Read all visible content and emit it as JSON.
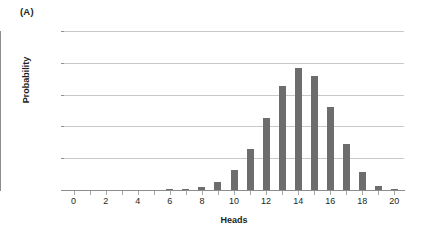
{
  "panel": {
    "label": "(A)"
  },
  "chart_data": {
    "type": "bar",
    "title": "",
    "panel_label": "(A)",
    "xlabel": "Heads",
    "ylabel": "Probability",
    "categories": [
      0,
      1,
      2,
      3,
      4,
      5,
      6,
      7,
      8,
      9,
      10,
      11,
      12,
      13,
      14,
      15,
      16,
      17,
      18,
      19,
      20
    ],
    "values": [
      0,
      0,
      0,
      0,
      0,
      0,
      0.0002,
      0.001,
      0.004,
      0.012,
      0.031,
      0.065,
      0.114,
      0.164,
      0.192,
      0.179,
      0.13,
      0.072,
      0.028,
      0.007,
      0.0008
    ],
    "x_tick_labels": [
      "0",
      "2",
      "4",
      "6",
      "8",
      "10",
      "12",
      "14",
      "16",
      "18",
      "20"
    ],
    "x_tick_values": [
      0,
      2,
      4,
      6,
      8,
      10,
      12,
      14,
      16,
      18,
      20
    ],
    "y_tick_labels": [
      "0",
      "0.05",
      "0.1",
      "0.15",
      "0.2",
      "0.25"
    ],
    "y_tick_values": [
      0,
      0.05,
      0.1,
      0.15,
      0.2,
      0.25
    ],
    "xlim": [
      -0.6,
      20.6
    ],
    "ylim": [
      0,
      0.25
    ],
    "grid": "horizontal",
    "legend": "none",
    "bar_color": "#6d6d6d",
    "gridline_color": "#c9c9c9",
    "axis_color": "#8d8d8d",
    "background_color": "#ffffff"
  }
}
